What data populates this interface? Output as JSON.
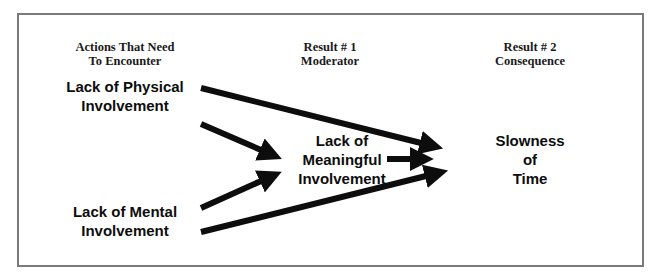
{
  "diagram": {
    "columns": [
      {
        "line1": "Actions That Need",
        "line2": "To Encounter"
      },
      {
        "line1": "Result # 1",
        "line2": "Moderator"
      },
      {
        "line1": "Result # 2",
        "line2": "Consequence"
      }
    ],
    "nodes": {
      "physical": {
        "line1": "Lack of Physical",
        "line2": "Involvement"
      },
      "mental": {
        "line1": "Lack of Mental",
        "line2": "Involvement"
      },
      "meaningful": {
        "line1": "Lack of",
        "line2": "Meaningful",
        "line3": "Involvement"
      },
      "slowness": {
        "line1": "Slowness",
        "line2": "of",
        "line3": "Time"
      }
    },
    "edges": [
      {
        "from": "physical",
        "to": "slowness"
      },
      {
        "from": "physical",
        "to": "meaningful"
      },
      {
        "from": "mental",
        "to": "meaningful"
      },
      {
        "from": "mental",
        "to": "slowness"
      },
      {
        "from": "meaningful",
        "to": "slowness"
      }
    ],
    "colors": {
      "border": "#7a7a7a",
      "arrow": "#0d0d0d",
      "text": "#0d0d0d"
    }
  }
}
